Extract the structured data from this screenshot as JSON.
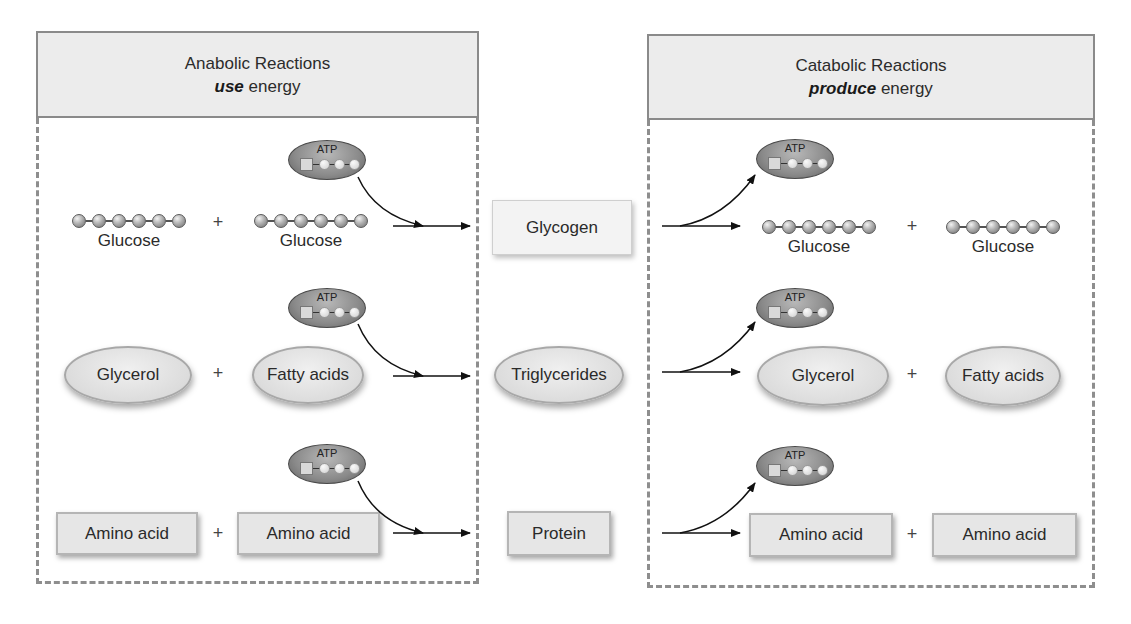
{
  "anabolic": {
    "title": "Anabolic Reactions",
    "subtitle_emph": "use",
    "subtitle_rest": " energy",
    "rows": [
      {
        "left": "Glucose",
        "right": "Glucose",
        "shape": "chain"
      },
      {
        "left": "Glycerol",
        "right": "Fatty acids",
        "shape": "oval"
      },
      {
        "left": "Amino acid",
        "right": "Amino acid",
        "shape": "rect"
      }
    ]
  },
  "products": [
    "Glycogen",
    "Triglycerides",
    "Protein"
  ],
  "catabolic": {
    "title": "Catabolic Reactions",
    "subtitle_emph": "produce",
    "subtitle_rest": " energy",
    "rows": [
      {
        "left": "Glucose",
        "right": "Glucose",
        "shape": "chain"
      },
      {
        "left": "Glycerol",
        "right": "Fatty acids",
        "shape": "oval"
      },
      {
        "left": "Amino acid",
        "right": "Amino acid",
        "shape": "rect"
      }
    ]
  },
  "atp_label": "ATP",
  "plus_sign": "+",
  "icons": {
    "energy_molecule": "atp-molecule-icon",
    "glucose_chain": "glucose-chain-icon"
  },
  "colors": {
    "panel_border": "#8e8e8e",
    "header_fill": "#ececec",
    "box_fill": "#e6e6e6"
  }
}
